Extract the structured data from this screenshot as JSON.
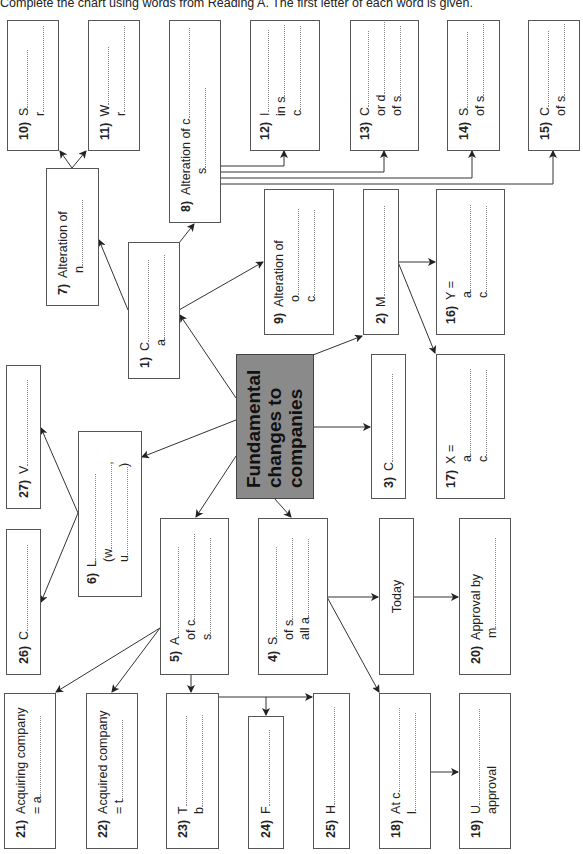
{
  "instruction": "Complete the chart using words from Reading A. The first letter of each word is given.",
  "center": {
    "lines": [
      "Fundamental",
      "changes to",
      "companies"
    ]
  },
  "boxes": {
    "b1": {
      "num": "1)",
      "lines": [
        "C",
        "a"
      ]
    },
    "b2": {
      "num": "2)",
      "lines": [
        "M"
      ]
    },
    "b3": {
      "num": "3)",
      "lines": [
        "C"
      ]
    },
    "b4": {
      "num": "4)",
      "lines": [
        "S",
        "of s",
        "all a"
      ]
    },
    "b5": {
      "num": "5)",
      "lines": [
        "A",
        "of c",
        "s"
      ]
    },
    "b6": {
      "num": "6)",
      "lines": [
        "L",
        "(w",
        "u"
      ]
    },
    "b7": {
      "num": "7)",
      "lines": [
        "Alteration of",
        "n"
      ]
    },
    "b8": {
      "num": "8)",
      "lines": [
        "Alteration of c",
        "s"
      ]
    },
    "b9": {
      "num": "9)",
      "lines": [
        "Alteration of",
        "o",
        "c"
      ]
    },
    "b10": {
      "num": "10)",
      "lines": [
        "S",
        "r"
      ]
    },
    "b11": {
      "num": "11)",
      "lines": [
        "W",
        "r"
      ]
    },
    "b12": {
      "num": "12)",
      "lines": [
        "I",
        "in s",
        "c"
      ]
    },
    "b13": {
      "num": "13)",
      "lines": [
        "C",
        "or d",
        "of s"
      ]
    },
    "b14": {
      "num": "14)",
      "lines": [
        "S",
        "of s"
      ]
    },
    "b15": {
      "num": "15)",
      "lines": [
        "C",
        "of s"
      ]
    },
    "b16": {
      "num": "16)",
      "lines": [
        "Y =",
        "a",
        "c"
      ]
    },
    "b17": {
      "num": "17)",
      "lines": [
        "X =",
        "a",
        "c"
      ]
    },
    "b18": {
      "num": "18)",
      "lines": [
        "At c",
        "l"
      ]
    },
    "b19": {
      "num": "19)",
      "lines": [
        "U",
        "approval"
      ]
    },
    "b20": {
      "num": "20)",
      "lines": [
        "Approval by",
        "m"
      ]
    },
    "b21": {
      "num": "21)",
      "lines": [
        "Acquiring company",
        "= a"
      ]
    },
    "b22": {
      "num": "22)",
      "lines": [
        "Acquired company",
        "= t"
      ]
    },
    "b23": {
      "num": "23)",
      "lines": [
        "T",
        "b"
      ]
    },
    "b24": {
      "num": "24)",
      "lines": [
        "F"
      ]
    },
    "b25": {
      "num": "25)",
      "lines": [
        "H"
      ]
    },
    "b26": {
      "num": "26)",
      "lines": [
        "C"
      ]
    },
    "b27": {
      "num": "27)",
      "lines": [
        "V"
      ]
    },
    "today": {
      "lines": [
        "Today"
      ]
    }
  }
}
